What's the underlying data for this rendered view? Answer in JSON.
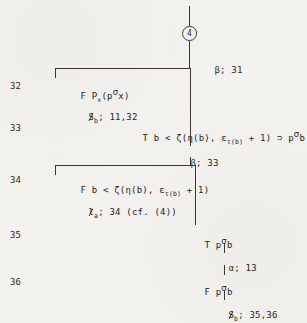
{
  "figure": {
    "kind": "semantic-tableau-proof-tree",
    "page_background": "#f4f2ee",
    "ink_color": "#27241f"
  },
  "top_node": {
    "label": "4",
    "shape": "circle"
  },
  "line_numbers": [
    "32",
    "33",
    "34",
    "35",
    "36"
  ],
  "rows": {
    "r32": {
      "number": "32",
      "formula_prefix": "F",
      "formula": "P",
      "formula_sub": "x",
      "formula_open": "(p",
      "formula_sup": "σ",
      "formula_rest": "x)",
      "full_text": "F P_x(p^σ x)"
    },
    "r33": {
      "number": "33",
      "formula_prefix": "T",
      "full_text": "T b < ζ(η(b), ε_τ(b) + 1) ⊃ p^σ b",
      "part_a": "T b < ζ(η(b), ε",
      "part_sub": "τ(b)",
      "part_b": " + 1) ⊃ p",
      "part_sup": "σ",
      "part_c": "b"
    },
    "r34": {
      "number": "34",
      "formula_prefix": "F",
      "full_text": "F b < ζ(η(b), ε_τ(b) + 1)",
      "part_a": "F b < ζ(η(b), ε",
      "part_sub": "τ(b)",
      "part_b": " + 1)"
    },
    "r35": {
      "number": "35",
      "formula_prefix": "T",
      "full_text": "T p^σ b",
      "part_a": "T p",
      "part_sup": "σ",
      "part_b": "b"
    },
    "r36": {
      "number": "36",
      "formula_prefix": "F",
      "full_text": "F p^σ b",
      "part_a": "F p",
      "part_sup": "σ",
      "part_b": "b"
    }
  },
  "annotations": {
    "a1": {
      "rule": "β",
      "refs": "31",
      "text": "β; 31"
    },
    "a2": {
      "rule": "$",
      "sub": "b",
      "refs": "11,32",
      "text": "$_b; 11,32"
    },
    "a3": {
      "rule": "β",
      "refs": "33",
      "text": "β; 33"
    },
    "a4": {
      "rule": "ℓ",
      "sub": "a",
      "refs": "34 (cf. (4))",
      "text": "ℓ_a; 34 (cf. (4))"
    },
    "a5": {
      "rule": "α",
      "refs": "13",
      "text": "α; 13"
    },
    "a6": {
      "rule": "$",
      "sub": "b",
      "refs": "35,36",
      "text": "$_b; 35,36"
    }
  },
  "glyphs": {
    "sigma": "σ",
    "tau": "τ",
    "eta": "η",
    "zeta": "ζ",
    "epsilon": "ε",
    "beta": "β",
    "alpha": "α",
    "ell": "ℓ",
    "superset": "⊃",
    "lessthan": "<",
    "semicolon": ";"
  }
}
